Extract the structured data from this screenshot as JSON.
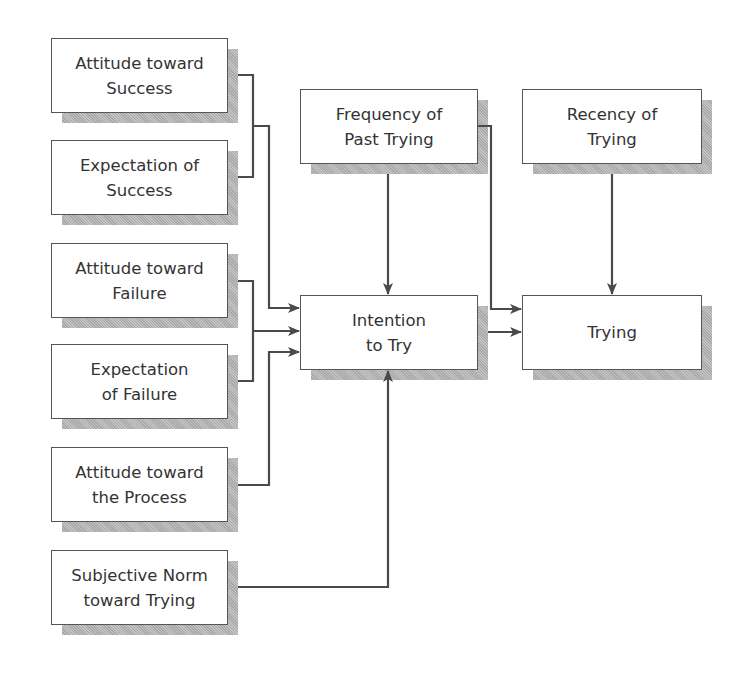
{
  "diagram": {
    "title": "",
    "nodes": {
      "attitude_success": {
        "label": "Attitude toward\nSuccess"
      },
      "expectation_success": {
        "label": "Expectation of\nSuccess"
      },
      "attitude_failure": {
        "label": "Attitude toward\nFailure"
      },
      "expectation_failure": {
        "label": "Expectation\nof Failure"
      },
      "attitude_process": {
        "label": "Attitude toward\nthe Process"
      },
      "subjective_norm": {
        "label": "Subjective Norm\ntoward Trying"
      },
      "frequency_past": {
        "label": "Frequency of\nPast Trying"
      },
      "recency": {
        "label": "Recency of\nTrying"
      },
      "intention": {
        "label": "Intention\nto Try"
      },
      "trying": {
        "label": "Trying"
      }
    },
    "edges": [
      {
        "from": [
          "Attitude toward Success",
          "Expectation of Success"
        ],
        "to": "Intention to Try"
      },
      {
        "from": [
          "Attitude toward Failure",
          "Expectation of Failure"
        ],
        "to": "Intention to Try"
      },
      {
        "from": "Attitude toward the Process",
        "to": "Intention to Try"
      },
      {
        "from": "Subjective Norm toward Trying",
        "to": "Intention to Try"
      },
      {
        "from": "Frequency of Past Trying",
        "to": "Intention to Try"
      },
      {
        "from": "Frequency of Past Trying",
        "to": "Trying"
      },
      {
        "from": "Intention to Try",
        "to": "Trying"
      },
      {
        "from": "Recency of Trying",
        "to": "Trying"
      }
    ],
    "colors": {
      "line": "#4a4a4a",
      "border": "#555555",
      "shadow": "#b3b3b3",
      "text": "#333333"
    }
  }
}
